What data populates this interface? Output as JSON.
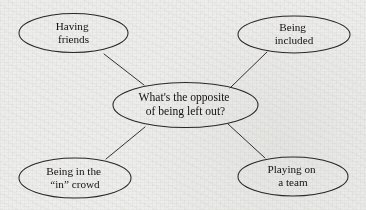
{
  "diagram": {
    "type": "concept-web",
    "background_color": "#eeeeec",
    "stroke_color": "#2a2724",
    "text_color": "#141210",
    "center_node": {
      "id": "center",
      "line1": "What's the opposite",
      "line2": "of being left out?",
      "cx": 185.5,
      "cy": 105,
      "rx": 72.5,
      "ry": 22.5
    },
    "leaf_nodes": [
      {
        "id": "having-friends",
        "line1": "Having",
        "line2": "friends",
        "cx": 73.5,
        "cy": 33,
        "rx": 54.5,
        "ry": 19.5
      },
      {
        "id": "being-included",
        "line1": "Being",
        "line2": "included",
        "cx": 294,
        "cy": 34.5,
        "rx": 56,
        "ry": 18.5
      },
      {
        "id": "being-in-the-in-crowd",
        "line1": "Being in the",
        "line2": "“in” crowd",
        "cx": 75,
        "cy": 178,
        "rx": 56,
        "ry": 20
      },
      {
        "id": "playing-on-a-team",
        "line1": "Playing on",
        "line2": "a team",
        "cx": 293,
        "cy": 176.5,
        "rx": 55,
        "ry": 19.5
      }
    ],
    "connectors": [
      {
        "id": "center-to-having-friends",
        "from": "center",
        "to": "having-friends",
        "x1": 144,
        "y1": 85,
        "x2": 104,
        "y2": 54
      },
      {
        "id": "center-to-being-included",
        "from": "center",
        "to": "being-included",
        "x1": 230,
        "y1": 88,
        "x2": 267,
        "y2": 52
      },
      {
        "id": "center-to-in-crowd",
        "from": "center",
        "to": "being-in-the-in-crowd",
        "x1": 145,
        "y1": 127,
        "x2": 106,
        "y2": 159
      },
      {
        "id": "center-to-playing-on-team",
        "from": "center",
        "to": "playing-on-a-team",
        "x1": 228,
        "y1": 124,
        "x2": 265,
        "y2": 158
      }
    ]
  }
}
